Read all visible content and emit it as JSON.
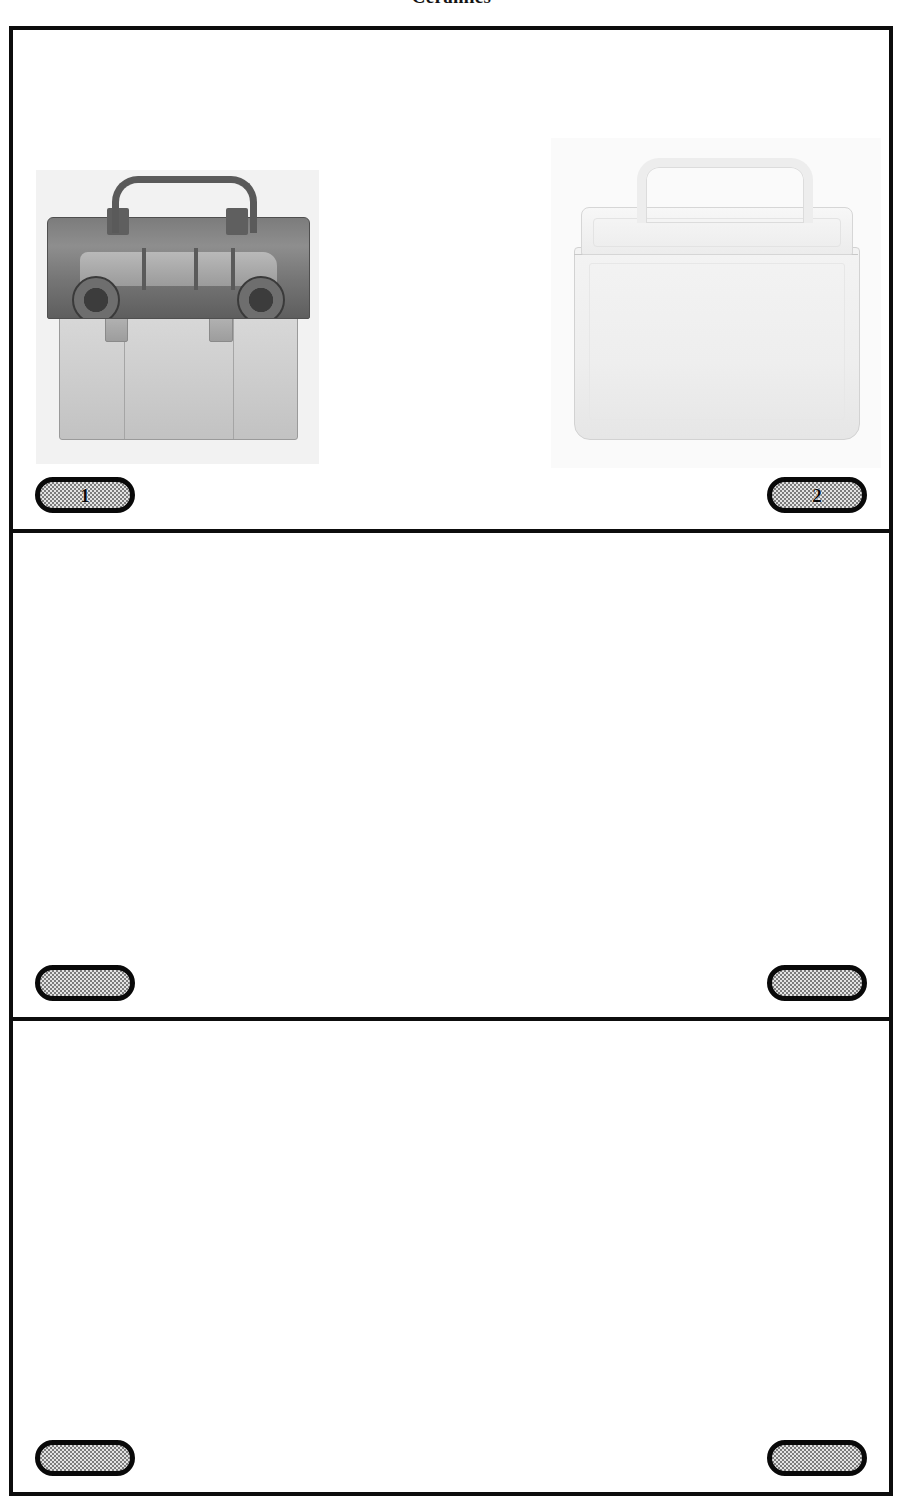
{
  "page": {
    "title": "Ceramics",
    "background_color": "#ffffff",
    "frame_border_color": "#0d0d0d",
    "bubble_fill_color": "#e4e4e4",
    "bubble_border_color": "#090909"
  },
  "rows": [
    {
      "row_index": 1,
      "slots": [
        {
          "position": "left",
          "bubble_label": "1",
          "has_photo": true,
          "photo": {
            "name": "ceramic-station-wagon-lunchbox-cookie-jar",
            "description": "Gray ceramic lunchbox-shaped cookie jar with an embossed station wagon on the lid and a molded carry handle",
            "tone": "gray"
          }
        },
        {
          "position": "right",
          "bubble_label": "2",
          "has_photo": true,
          "photo": {
            "name": "plain-white-ceramic-lunchbox",
            "description": "Plain white ceramic lunchbox with rounded corners, a fitted lid and a molded carry handle",
            "tone": "white"
          }
        }
      ]
    },
    {
      "row_index": 2,
      "slots": [
        {
          "position": "left",
          "bubble_label": "",
          "has_photo": false
        },
        {
          "position": "right",
          "bubble_label": "",
          "has_photo": false
        }
      ]
    },
    {
      "row_index": 3,
      "slots": [
        {
          "position": "left",
          "bubble_label": "",
          "has_photo": false
        },
        {
          "position": "right",
          "bubble_label": "",
          "has_photo": false
        }
      ]
    }
  ]
}
